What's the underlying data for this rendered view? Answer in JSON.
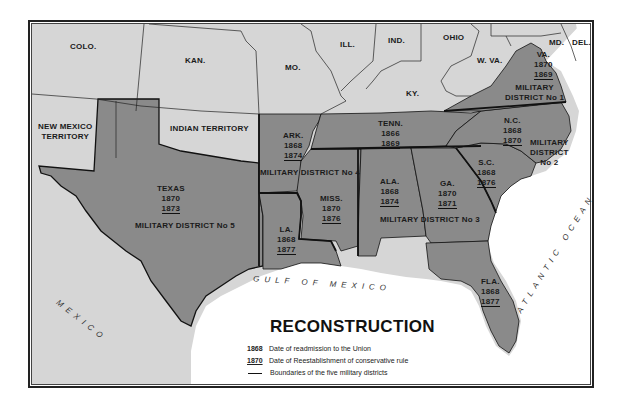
{
  "title": "RECONSTRUCTION",
  "colors": {
    "union_states": "#d6d6d6",
    "former_confederate_states": "#8a8a8a",
    "water": "#ffffff",
    "borders": "#111111"
  },
  "legend": {
    "readmission": {
      "key": "1868",
      "label": "Date of readmission to the Union"
    },
    "conservative": {
      "key": "1870",
      "label": "Date of Reestablishment of conservative rule"
    },
    "boundary": {
      "label": "Boundaries of the five military districts"
    }
  },
  "other_regions": {
    "colo": "COLO.",
    "kan": "KAN.",
    "mo": "MO.",
    "ill": "ILL.",
    "ind": "IND.",
    "ohio": "OHIO",
    "wva": "W. VA.",
    "md": "MD.",
    "del": "DEL.",
    "ky": "KY.",
    "new_mexico_1": "NEW MEXICO",
    "new_mexico_2": "TERRITORY",
    "indian_territory": "INDIAN TERRITORY",
    "mexico": "MEXICO"
  },
  "water": {
    "gulf": "GULF OF MEXICO",
    "atlantic": "ATLANTIC OCEAN"
  },
  "states": {
    "va": {
      "name": "VA.",
      "readmitted": "1870",
      "conservative": "1869"
    },
    "nc": {
      "name": "N.C.",
      "readmitted": "1868",
      "conservative": "1870"
    },
    "sc": {
      "name": "S.C.",
      "readmitted": "1868",
      "conservative": "1876"
    },
    "ga": {
      "name": "GA.",
      "readmitted": "1870",
      "conservative": "1871"
    },
    "fla": {
      "name": "FLA.",
      "readmitted": "1868",
      "conservative": "1877"
    },
    "ala": {
      "name": "ALA.",
      "readmitted": "1868",
      "conservative": "1874"
    },
    "miss": {
      "name": "MISS.",
      "readmitted": "1870",
      "conservative": "1876"
    },
    "la": {
      "name": "LA.",
      "readmitted": "1868",
      "conservative": "1877"
    },
    "ark": {
      "name": "ARK.",
      "readmitted": "1868",
      "conservative": "1874"
    },
    "tenn": {
      "name": "TENN.",
      "readmitted": "1866",
      "conservative": "1869"
    },
    "texas": {
      "name": "TEXAS",
      "readmitted": "1870",
      "conservative": "1873"
    }
  },
  "districts": {
    "d1_a": "MILITARY",
    "d1_b": "DISTRICT No 1",
    "d2_a": "MILITARY",
    "d2_b": "DISTRICT",
    "d2_c": "No 2",
    "d3": "MILITARY DISTRICT No 3",
    "d4": "MILITARY DISTRICT No 4",
    "d5": "MILITARY DISTRICT No 5"
  }
}
